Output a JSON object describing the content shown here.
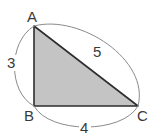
{
  "diagram": {
    "type": "right-triangle",
    "vertices": {
      "A": {
        "label": "A",
        "x": 34,
        "y": 26
      },
      "B": {
        "label": "B",
        "x": 34,
        "y": 106
      },
      "C": {
        "label": "C",
        "x": 138,
        "y": 106
      }
    },
    "sides": {
      "AB": {
        "length_label": "3"
      },
      "BC": {
        "length_label": "4"
      },
      "AC": {
        "length_label": "5"
      }
    },
    "colors": {
      "fill": "#c4c4c4",
      "edge": "#2e2e2e",
      "arc": "#8a8a8a",
      "text": "#3a3a3a"
    }
  }
}
